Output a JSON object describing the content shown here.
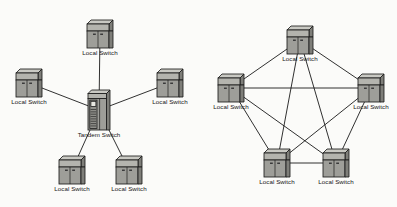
{
  "figure": {
    "background_color": "#fbfbf9",
    "line_color": "#1a1a1a",
    "icon_fill": "#9e9e99",
    "icon_top": "#c9c9c3",
    "icon_shadow": "#7e7e79",
    "label_color": "#141414"
  },
  "labels": {
    "local_switch": "Local Switch",
    "tandem_switch": "Tandem Switch"
  },
  "diagrams": [
    {
      "id": "star-topology",
      "name": "tandem-star-topology",
      "topology": "star",
      "nodes": [
        {
          "id": "L-top",
          "label": "Local Switch",
          "type": "local",
          "x": 100,
          "y": 34
        },
        {
          "id": "L-left",
          "label": "Local Switch",
          "type": "local",
          "x": 29,
          "y": 83
        },
        {
          "id": "L-right",
          "label": "Local Switch",
          "type": "local",
          "x": 170,
          "y": 83
        },
        {
          "id": "T-center",
          "label": "Tandem Switch",
          "type": "tandem",
          "x": 99,
          "y": 110
        },
        {
          "id": "L-bl",
          "label": "Local Switch",
          "type": "local",
          "x": 72,
          "y": 170
        },
        {
          "id": "L-br",
          "label": "Local Switch",
          "type": "local",
          "x": 129,
          "y": 170
        }
      ],
      "edges": [
        {
          "from": "T-center",
          "to": "L-top"
        },
        {
          "from": "T-center",
          "to": "L-left"
        },
        {
          "from": "T-center",
          "to": "L-right"
        },
        {
          "from": "T-center",
          "to": "L-bl"
        },
        {
          "from": "T-center",
          "to": "L-br"
        }
      ]
    },
    {
      "id": "mesh-topology",
      "name": "full-mesh-topology",
      "topology": "full-mesh",
      "nodes": [
        {
          "id": "M-top",
          "label": "Local Switch",
          "type": "local",
          "x": 300,
          "y": 40
        },
        {
          "id": "M-left",
          "label": "Local Switch",
          "type": "local",
          "x": 231,
          "y": 88
        },
        {
          "id": "M-right",
          "label": "Local Switch",
          "type": "local",
          "x": 371,
          "y": 88
        },
        {
          "id": "M-bl",
          "label": "Local Switch",
          "type": "local",
          "x": 277,
          "y": 163
        },
        {
          "id": "M-br",
          "label": "Local Switch",
          "type": "local",
          "x": 336,
          "y": 163
        }
      ],
      "edges": [
        {
          "from": "M-top",
          "to": "M-left"
        },
        {
          "from": "M-top",
          "to": "M-right"
        },
        {
          "from": "M-top",
          "to": "M-bl"
        },
        {
          "from": "M-top",
          "to": "M-br"
        },
        {
          "from": "M-left",
          "to": "M-right"
        },
        {
          "from": "M-left",
          "to": "M-bl"
        },
        {
          "from": "M-left",
          "to": "M-br"
        },
        {
          "from": "M-right",
          "to": "M-bl"
        },
        {
          "from": "M-right",
          "to": "M-br"
        },
        {
          "from": "M-bl",
          "to": "M-br"
        }
      ]
    }
  ]
}
